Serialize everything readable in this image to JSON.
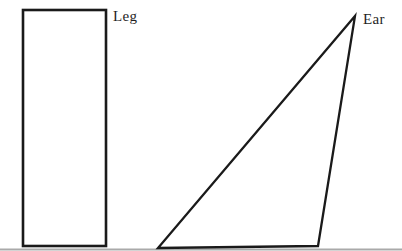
{
  "figure": {
    "background_color": "#ffffff",
    "stroke_color": "#1a1a1a",
    "bottom_edge_color": "#aaaaaa",
    "shapes": [
      {
        "type": "rectangle",
        "label": "Leg"
      },
      {
        "type": "triangle",
        "label": "Ear"
      }
    ]
  }
}
